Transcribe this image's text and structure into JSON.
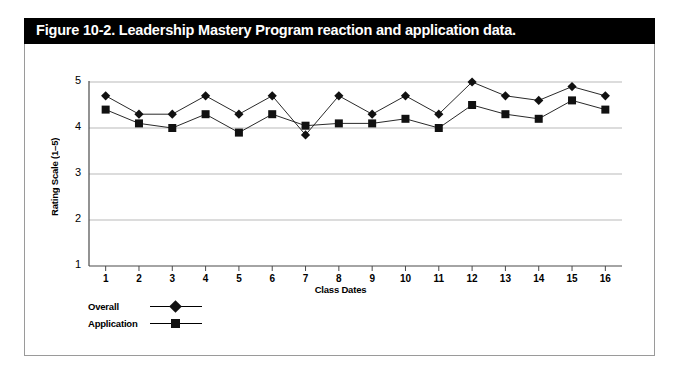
{
  "figure": {
    "title": "Figure 10-2. Leadership Mastery Program reaction and application data.",
    "title_bar_color": "#000000",
    "title_text_color": "#ffffff",
    "frame_border_color": "#9a9a9a"
  },
  "chart_data": {
    "type": "line",
    "title": "",
    "xlabel": "Class Dates",
    "ylabel": "Rating Scale (1–5)",
    "categories": [
      "1",
      "2",
      "3",
      "4",
      "5",
      "6",
      "7",
      "8",
      "9",
      "10",
      "11",
      "12",
      "13",
      "14",
      "15",
      "16"
    ],
    "x": [
      1,
      2,
      3,
      4,
      5,
      6,
      7,
      8,
      9,
      10,
      11,
      12,
      13,
      14,
      15,
      16
    ],
    "series": [
      {
        "name": "Overall",
        "marker": "diamond",
        "color": "#111111",
        "values": [
          4.7,
          4.3,
          4.3,
          4.7,
          4.3,
          4.7,
          3.85,
          4.7,
          4.3,
          4.7,
          4.3,
          5.0,
          4.7,
          4.6,
          4.9,
          4.7
        ]
      },
      {
        "name": "Application",
        "marker": "square",
        "color": "#111111",
        "values": [
          4.4,
          4.1,
          4.0,
          4.3,
          3.9,
          4.3,
          4.05,
          4.1,
          4.1,
          4.2,
          4.0,
          4.5,
          4.3,
          4.2,
          4.6,
          4.4
        ]
      }
    ],
    "ylim": [
      1,
      5
    ],
    "yticks": [
      1,
      2,
      3,
      4,
      5
    ],
    "ytick_labels": [
      "1",
      "2",
      "3",
      "4",
      "5"
    ],
    "xlim": [
      0.5,
      16.5
    ],
    "grid": "horizontal",
    "grid_color": "#b9b9b9",
    "legend_position": "below-left",
    "legend": [
      "Overall",
      "Application"
    ]
  }
}
